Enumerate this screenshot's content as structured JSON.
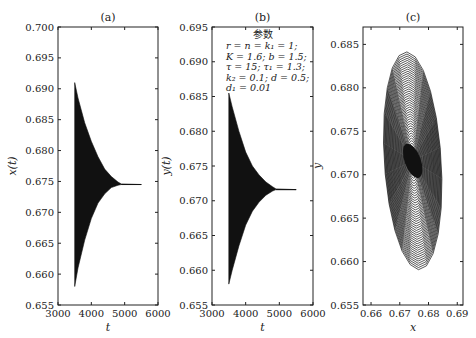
{
  "chart_data": [
    {
      "id": "a",
      "type": "line",
      "title": "(a)",
      "xlabel": "t",
      "ylabel": "x(t)",
      "xlim": [
        3000,
        6000
      ],
      "ylim": [
        0.655,
        0.7
      ],
      "xticks": [
        3000,
        4000,
        5000,
        6000
      ],
      "yticks": [
        0.655,
        0.66,
        0.665,
        0.67,
        0.675,
        0.68,
        0.685,
        0.69,
        0.695,
        0.7
      ],
      "grid": false,
      "description": "Damped oscillation band: start t=3500, envelope upper 0.691 / lower 0.658, converging to 0.6745 near t=4900, constant until t=5500",
      "envelope": {
        "t": [
          3500,
          3600,
          3800,
          4000,
          4200,
          4400,
          4600,
          4800,
          4900,
          5500
        ],
        "upper": [
          0.691,
          0.6885,
          0.6845,
          0.6815,
          0.679,
          0.677,
          0.6758,
          0.6749,
          0.6746,
          0.6745
        ],
        "lower": [
          0.658,
          0.661,
          0.6655,
          0.669,
          0.6715,
          0.673,
          0.674,
          0.6744,
          0.6745,
          0.6745
        ]
      },
      "equilibrium": 0.6745
    },
    {
      "id": "b",
      "type": "line",
      "title": "(b)",
      "xlabel": "t",
      "ylabel": "y(t)",
      "xlim": [
        3000,
        6000
      ],
      "ylim": [
        0.655,
        0.695
      ],
      "xticks": [
        3000,
        4000,
        5000,
        6000
      ],
      "yticks": [
        0.655,
        0.66,
        0.665,
        0.67,
        0.675,
        0.68,
        0.685,
        0.69,
        0.695
      ],
      "grid": false,
      "description": "Damped oscillation band: start t=3500, envelope upper 0.6855 / lower 0.658, converging to 0.6716 near t=4900, constant until t=5500",
      "envelope": {
        "t": [
          3500,
          3600,
          3800,
          4000,
          4200,
          4400,
          4600,
          4800,
          4900,
          5500
        ],
        "upper": [
          0.6855,
          0.6835,
          0.68,
          0.677,
          0.675,
          0.6737,
          0.6727,
          0.672,
          0.6717,
          0.6716
        ],
        "lower": [
          0.658,
          0.66,
          0.6635,
          0.6665,
          0.6685,
          0.6698,
          0.6708,
          0.6714,
          0.6716,
          0.6716
        ]
      },
      "equilibrium": 0.6716,
      "annotation": {
        "title": "参数",
        "lines": [
          "r = n = k₁ = 1;",
          "K = 1.6; b = 1.5;",
          "τ = 15; τ₁ = 1.3;",
          "k₂ = 0.1; d = 0.5;",
          "d₁ = 0.01"
        ]
      }
    },
    {
      "id": "c",
      "type": "line",
      "title": "(c)",
      "xlabel": "x",
      "ylabel": "y",
      "xlim": [
        0.6572,
        0.692
      ],
      "ylim": [
        0.655,
        0.687
      ],
      "xticks": [
        0.66,
        0.67,
        0.68,
        0.69
      ],
      "yticks": [
        0.655,
        0.66,
        0.665,
        0.67,
        0.675,
        0.68,
        0.685
      ],
      "grid": false,
      "description": "Phase portrait: nested tilted ellipses spiraling inward to equilibrium (0.6745, 0.6716); outer orbit x from ~0.657 to ~0.692, y from ~0.658 to ~0.685",
      "center": [
        0.6745,
        0.6716
      ],
      "outer_extent": {
        "x": [
          0.657,
          0.692
        ],
        "y": [
          0.658,
          0.6853
        ]
      }
    }
  ]
}
